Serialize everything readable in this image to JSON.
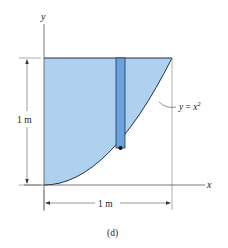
{
  "figure": {
    "caption": "(d)",
    "axes": {
      "x_label": "x",
      "y_label": "y"
    },
    "curve_label": {
      "lhs": "y",
      "eq": " = ",
      "rhs": "x",
      "exponent": "2"
    },
    "dimensions": {
      "height_label": "1 m",
      "width_label": "1 m"
    },
    "colors": {
      "region_fill": "#aed1f0",
      "strip_fill": "#6aa3df",
      "stroke": "#2a2f45",
      "axis": "#555555"
    }
  }
}
